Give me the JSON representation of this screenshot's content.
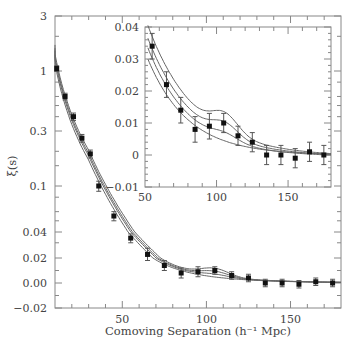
{
  "chart_data": {
    "type": "scatter",
    "title": "",
    "xlabel": "Comoving Separation (h⁻¹ Mpc)",
    "ylabel": "ξ(s)",
    "main": {
      "xlim": [
        10,
        180
      ],
      "x_ticks": [
        50,
        100,
        150
      ],
      "y_ticks": [
        "3",
        "1",
        "0.3",
        "0.1",
        "0.04",
        "0.02",
        "0.00",
        "−0.02"
      ],
      "y_scale": "mixed log/linear",
      "points": [
        {
          "x": 11,
          "y": 1.05,
          "err": 0.06
        },
        {
          "x": 16,
          "y": 0.6,
          "err": 0.04
        },
        {
          "x": 21,
          "y": 0.4,
          "err": 0.03
        },
        {
          "x": 26,
          "y": 0.26,
          "err": 0.02
        },
        {
          "x": 31,
          "y": 0.19,
          "err": 0.015
        },
        {
          "x": 36,
          "y": 0.1,
          "err": 0.01
        },
        {
          "x": 45,
          "y": 0.055,
          "err": 0.005
        },
        {
          "x": 55,
          "y": 0.034,
          "err": 0.004
        },
        {
          "x": 65,
          "y": 0.022,
          "err": 0.004
        },
        {
          "x": 75,
          "y": 0.014,
          "err": 0.004
        },
        {
          "x": 85,
          "y": 0.008,
          "err": 0.004
        },
        {
          "x": 95,
          "y": 0.009,
          "err": 0.004
        },
        {
          "x": 105,
          "y": 0.01,
          "err": 0.003
        },
        {
          "x": 115,
          "y": 0.006,
          "err": 0.003
        },
        {
          "x": 125,
          "y": 0.004,
          "err": 0.003
        },
        {
          "x": 135,
          "y": 0.0,
          "err": 0.003
        },
        {
          "x": 145,
          "y": 0.0,
          "err": 0.003
        },
        {
          "x": 155,
          "y": -0.001,
          "err": 0.003
        },
        {
          "x": 165,
          "y": 0.001,
          "err": 0.003
        },
        {
          "x": 175,
          "y": 0.0,
          "err": 0.003
        }
      ]
    },
    "inset": {
      "xlim": [
        50,
        180
      ],
      "ylim": [
        -0.01,
        0.04
      ],
      "x_ticks": [
        50,
        100,
        150
      ],
      "y_ticks": [
        "0.04",
        "0.03",
        "0.02",
        "0.01",
        "0",
        "−0.01"
      ],
      "points": [
        {
          "x": 55,
          "y": 0.034,
          "err": 0.004
        },
        {
          "x": 65,
          "y": 0.022,
          "err": 0.004
        },
        {
          "x": 75,
          "y": 0.014,
          "err": 0.004
        },
        {
          "x": 85,
          "y": 0.008,
          "err": 0.004
        },
        {
          "x": 95,
          "y": 0.009,
          "err": 0.004
        },
        {
          "x": 105,
          "y": 0.01,
          "err": 0.003
        },
        {
          "x": 115,
          "y": 0.006,
          "err": 0.003
        },
        {
          "x": 125,
          "y": 0.004,
          "err": 0.003
        },
        {
          "x": 135,
          "y": 0.0,
          "err": 0.003
        },
        {
          "x": 145,
          "y": 0.0,
          "err": 0.003
        },
        {
          "x": 155,
          "y": -0.001,
          "err": 0.003
        },
        {
          "x": 165,
          "y": 0.001,
          "err": 0.003
        },
        {
          "x": 175,
          "y": 0.0,
          "err": 0.003
        }
      ]
    },
    "model_curves": 4,
    "colors": {
      "points": "#111111",
      "curves": "#666666",
      "axes": "#888888",
      "text": "#444444"
    }
  }
}
